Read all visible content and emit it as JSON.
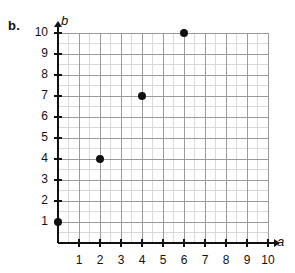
{
  "part_label": "b.",
  "chart_data": {
    "type": "scatter",
    "title": "",
    "xlabel": "a",
    "ylabel": "b",
    "xlim": [
      0,
      10
    ],
    "ylim": [
      0,
      10
    ],
    "xticks": [
      1,
      2,
      3,
      4,
      5,
      6,
      7,
      8,
      9,
      10
    ],
    "yticks": [
      1,
      2,
      3,
      4,
      5,
      6,
      7,
      8,
      9,
      10
    ],
    "xtick_labels": [
      "1",
      "2",
      "3",
      "4",
      "5",
      "6",
      "7",
      "8",
      "9",
      "10"
    ],
    "ytick_labels": [
      "1",
      "2",
      "3",
      "4",
      "5",
      "6",
      "7",
      "8",
      "9",
      "10"
    ],
    "grid": true,
    "minor_grid": true,
    "minor_step": 0.5,
    "legend": null,
    "points": [
      {
        "x": 0,
        "y": 1
      },
      {
        "x": 2,
        "y": 4
      },
      {
        "x": 4,
        "y": 7
      },
      {
        "x": 6,
        "y": 10
      }
    ],
    "colors": {
      "point": "#111111",
      "axis": "#111111",
      "major_grid": "#9a9a9a",
      "minor_grid": "#d8d8d8",
      "background": "#ffffff"
    }
  }
}
